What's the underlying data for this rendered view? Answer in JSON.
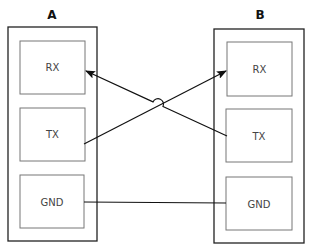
{
  "diagram": {
    "devices": [
      {
        "id": "A",
        "label": "A",
        "pins": [
          {
            "label": "RX"
          },
          {
            "label": "TX"
          },
          {
            "label": "GND"
          }
        ]
      },
      {
        "id": "B",
        "label": "B",
        "pins": [
          {
            "label": "RX"
          },
          {
            "label": "TX"
          },
          {
            "label": "GND"
          }
        ]
      }
    ],
    "connections": [
      {
        "from": "A.TX",
        "to": "B.RX",
        "arrow": "end"
      },
      {
        "from": "B.TX",
        "to": "A.RX",
        "arrow": "end",
        "hop_over_crossing": true
      },
      {
        "from": "A.GND",
        "to": "B.GND",
        "arrow": "none"
      }
    ],
    "colors": {
      "outer_stroke": "#222222",
      "inner_stroke": "#777777",
      "wire": "#111111",
      "text": "#444444"
    }
  }
}
